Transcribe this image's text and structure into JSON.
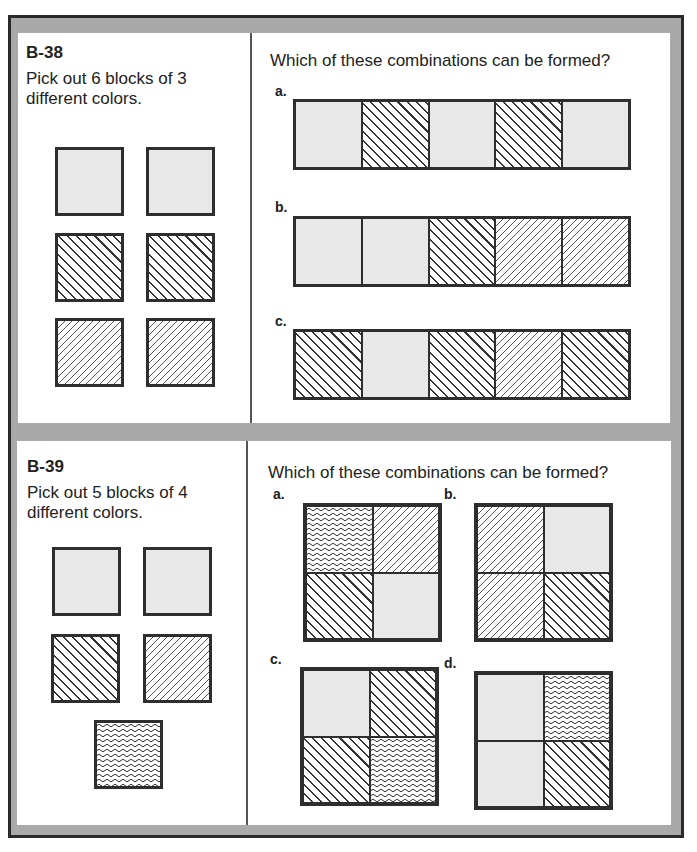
{
  "problems": [
    {
      "id": "B-38",
      "instruction": "Pick out 6 blocks of 3 different colors.",
      "instruction_lines": [
        "Pick out 6 blocks of 3",
        "different colors."
      ],
      "blocks": [
        "gray",
        "gray",
        "stripe",
        "stripe",
        "dot",
        "dot"
      ],
      "question": "Which of these combinations can be formed?",
      "options": [
        {
          "label": "a.",
          "cells": [
            "gray",
            "stripe",
            "gray",
            "stripe",
            "gray"
          ]
        },
        {
          "label": "b.",
          "cells": [
            "gray",
            "gray",
            "stripe",
            "dot",
            "dot"
          ]
        },
        {
          "label": "c.",
          "cells": [
            "stripe",
            "gray",
            "stripe",
            "dot",
            "stripe"
          ]
        }
      ]
    },
    {
      "id": "B-39",
      "instruction": "Pick out 5 blocks of 4 different colors.",
      "instruction_lines": [
        "Pick out 5 blocks of 4",
        "different colors."
      ],
      "blocks": [
        "gray",
        "gray",
        "stripe",
        "dot",
        "wave"
      ],
      "question": "Which of these combinations can be formed?",
      "options": [
        {
          "label": "a.",
          "cells": [
            "wave",
            "dot",
            "stripe",
            "gray"
          ]
        },
        {
          "label": "b.",
          "cells": [
            "dot",
            "gray",
            "dot",
            "stripe"
          ]
        },
        {
          "label": "c.",
          "cells": [
            "gray",
            "stripe",
            "stripe",
            "wave"
          ]
        },
        {
          "label": "d.",
          "cells": [
            "gray",
            "wave",
            "gray",
            "stripe"
          ]
        }
      ]
    }
  ],
  "pattern_legend": {
    "gray": "solid-light-gray",
    "stripe": "diagonal-stripes",
    "dot": "dash-dot-texture",
    "wave": "wavy-lines"
  }
}
